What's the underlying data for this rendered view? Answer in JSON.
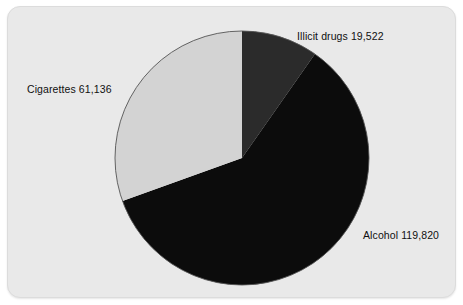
{
  "chart_data": {
    "type": "pie",
    "title": "",
    "subtitle": "",
    "xlabel": "",
    "ylabel": "",
    "legend_position": "none",
    "grid": false,
    "labels_inline": true,
    "start_angle_deg": 0,
    "direction": "clockwise",
    "total": 200478,
    "categories": [
      "Illicit drugs",
      "Alcohol",
      "Cigarettes"
    ],
    "values": [
      19522,
      119820,
      61136
    ],
    "slices": [
      {
        "name": "Illicit drugs",
        "value": 19522,
        "value_text": "19,522",
        "label": "Illicit drugs 19,522",
        "percent": 9.74,
        "angle_deg": 35.06,
        "start_deg": 0,
        "end_deg": 35.06,
        "color": "#2b2b2b"
      },
      {
        "name": "Alcohol",
        "value": 119820,
        "value_text": "119,820",
        "label": "Alcohol 119,820",
        "percent": 59.77,
        "angle_deg": 215.18,
        "start_deg": 35.06,
        "end_deg": 250.24,
        "color": "#0c0c0c"
      },
      {
        "name": "Cigarettes",
        "value": 61136,
        "value_text": "61,136",
        "label": "Cigarettes 61,136",
        "percent": 30.49,
        "angle_deg": 109.76,
        "start_deg": 250.24,
        "end_deg": 360,
        "color": "#d3d3d3"
      }
    ],
    "geometry": {
      "center_x": 234,
      "center_y": 151,
      "radius": 127
    }
  },
  "colors": {
    "page_background": "#ffffff",
    "card_background": "#e9e9e9",
    "card_border": "#dcdcdc",
    "pie_outline": "#555555",
    "label_text": "#101010"
  },
  "labels": {
    "illicit_drugs": "Illicit drugs 19,522",
    "cigarettes": "Cigarettes 61,136",
    "alcohol": "Alcohol 119,820"
  }
}
